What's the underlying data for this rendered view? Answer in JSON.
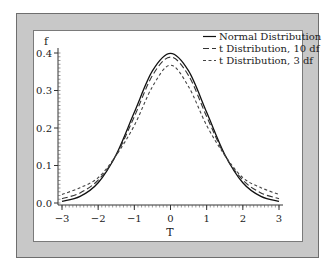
{
  "chart_data": {
    "type": "line",
    "title": "",
    "xlabel": "T",
    "ylabel": "f",
    "xlim": [
      -3,
      3
    ],
    "ylim": [
      0,
      0.4
    ],
    "x_ticks": [
      -3,
      -2,
      -1,
      0,
      1,
      2,
      3
    ],
    "x_tick_labels": [
      "−3",
      "−2",
      "−1",
      "0",
      "1",
      "2",
      "3"
    ],
    "y_ticks": [
      0.0,
      0.1,
      0.2,
      0.3,
      0.4
    ],
    "y_tick_labels": [
      "0.0",
      "0.1",
      "0.2",
      "0.3",
      "0.4"
    ],
    "grid": false,
    "legend_position": "top-right",
    "x": [
      -3,
      -2.5,
      -2,
      -1.5,
      -1,
      -0.5,
      0,
      0.5,
      1,
      1.5,
      2,
      2.5,
      3
    ],
    "series": [
      {
        "name": "Normal Distribution",
        "style": "solid",
        "values": [
          0.0044,
          0.0175,
          0.054,
          0.1295,
          0.242,
          0.3521,
          0.3989,
          0.3521,
          0.242,
          0.1295,
          0.054,
          0.0175,
          0.0044
        ]
      },
      {
        "name": "t Distribution, 10 df",
        "style": "dashed",
        "values": [
          0.0114,
          0.0269,
          0.0611,
          0.1274,
          0.2304,
          0.3397,
          0.3891,
          0.3397,
          0.2304,
          0.1274,
          0.0611,
          0.0269,
          0.0114
        ]
      },
      {
        "name": "t Distribution, 3 df",
        "style": "dotted",
        "values": [
          0.0229,
          0.0409,
          0.0675,
          0.1274,
          0.2067,
          0.3101,
          0.3676,
          0.3101,
          0.2067,
          0.1274,
          0.0675,
          0.0409,
          0.0229
        ]
      }
    ]
  }
}
